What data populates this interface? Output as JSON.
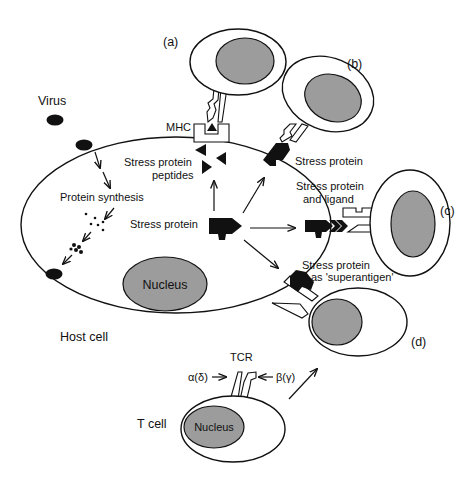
{
  "diagram": {
    "colors": {
      "outline": "#111111",
      "nucleus_fill": "#9c9c9c",
      "background": "#ffffff"
    },
    "labels": {
      "virus": "Virus",
      "mhc": "MHC",
      "stress_protein_peptides_1": "Stress protein",
      "stress_protein_peptides_2": "peptides",
      "protein_synthesis": "Protein synthesis",
      "stress_protein_center": "Stress protein",
      "nucleus_host": "Nucleus",
      "host_cell": "Host cell",
      "panel_a": "(a)",
      "panel_b": "(b)",
      "panel_c": "(c)",
      "panel_d": "(d)",
      "stress_protein_b": "Stress protein",
      "stress_protein_ligand_1": "Stress protein",
      "stress_protein_ligand_2": "and  ligand",
      "superantigen_1": "Stress protein",
      "superantigen_2": "as 'superantigen'",
      "tcr": "TCR",
      "alpha_delta": "α(δ)",
      "beta_gamma": "β(γ)",
      "t_cell": "T cell",
      "nucleus_tcell": "Nucleus"
    }
  }
}
